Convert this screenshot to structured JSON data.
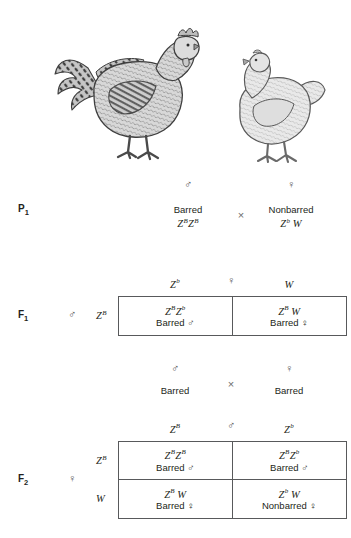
{
  "illustration": {
    "rooster_alt": "barred rooster",
    "hen_alt": "nonbarred hen"
  },
  "symbols": {
    "male": "♂",
    "female": "♀",
    "cross": "×"
  },
  "generations": {
    "p1": {
      "label": "P",
      "sub": "1",
      "male_symbol": "♂",
      "female_symbol": "♀",
      "cross": "×",
      "father": {
        "phenotype": "Barred",
        "allele1": "Z",
        "sup1": "B",
        "allele2": "Z",
        "sup2": "B"
      },
      "mother": {
        "phenotype": "Nonbarred",
        "allele1": "Z",
        "sup1": "b",
        "allele2": "W",
        "sup2": ""
      }
    },
    "f1": {
      "label": "F",
      "sub": "1",
      "row_parent_symbol": "♂",
      "row_parent_gamete": "Z",
      "row_parent_sup": "B",
      "col_parent_symbol": "♀",
      "col_gametes": [
        {
          "allele": "Z",
          "sup": "b"
        },
        {
          "allele": "W",
          "sup": ""
        }
      ],
      "cells": [
        {
          "genotype": "Z^B Z^b",
          "a1": "Z",
          "s1": "B",
          "a2": "Z",
          "s2": "b",
          "phenotype": "Barred",
          "sex": "♂"
        },
        {
          "genotype": "Z^B W",
          "a1": "Z",
          "s1": "B",
          "a2": "W",
          "s2": "",
          "phenotype": "Barred",
          "sex": "♀"
        }
      ]
    },
    "f1_cross": {
      "male_symbol": "♂",
      "female_symbol": "♀",
      "cross": "×",
      "male_phenotype": "Barred",
      "female_phenotype": "Barred"
    },
    "f2": {
      "label": "F",
      "sub": "2",
      "row_parent_symbol": "♀",
      "row_gametes": [
        {
          "allele": "Z",
          "sup": "B"
        },
        {
          "allele": "W",
          "sup": ""
        }
      ],
      "col_parent_symbol": "♂",
      "col_gametes": [
        {
          "allele": "Z",
          "sup": "B"
        },
        {
          "allele": "Z",
          "sup": "b"
        }
      ],
      "cells": [
        {
          "a1": "Z",
          "s1": "B",
          "a2": "Z",
          "s2": "B",
          "phenotype": "Barred",
          "sex": "♂"
        },
        {
          "a1": "Z",
          "s1": "B",
          "a2": "Z",
          "s2": "b",
          "phenotype": "Barred",
          "sex": "♂"
        },
        {
          "a1": "Z",
          "s1": "B",
          "a2": "W",
          "s2": "",
          "phenotype": "Barred",
          "sex": "♀"
        },
        {
          "a1": "Z",
          "s1": "b",
          "a2": "W",
          "s2": "",
          "phenotype": "Nonbarred",
          "sex": "♀"
        }
      ]
    }
  },
  "colors": {
    "text": "#231f20",
    "border": "#58595b",
    "muted": "#6d6d6d",
    "background": "#ffffff"
  }
}
